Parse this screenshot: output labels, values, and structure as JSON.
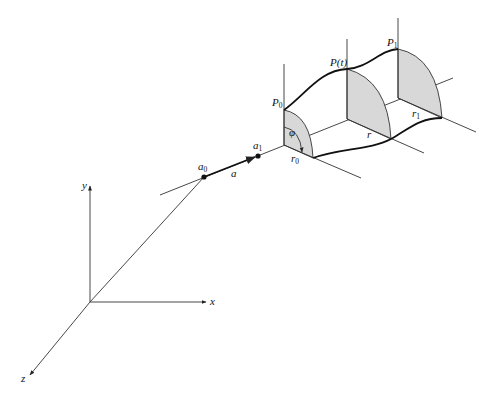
{
  "figure": {
    "axes": {
      "x_label": "x",
      "y_label": "y",
      "z_label": "z"
    },
    "axis_points": {
      "a0": {
        "label": "a",
        "sub": "0"
      },
      "a1": {
        "label": "a",
        "sub": "1"
      },
      "direction": {
        "label": "a"
      }
    },
    "cross_sections": [
      {
        "label": "P",
        "sub": "0",
        "radius_label": "r",
        "radius_sub": "0"
      },
      {
        "label": "P(t)",
        "sub": "",
        "radius_label": "r",
        "radius_sub": ""
      },
      {
        "label": "P",
        "sub": "1",
        "radius_label": "r",
        "radius_sub": "1"
      }
    ],
    "angle_label": "φ",
    "colors": {
      "line": "#333333",
      "shade": "#d8d8d8",
      "background": "#ffffff"
    }
  }
}
